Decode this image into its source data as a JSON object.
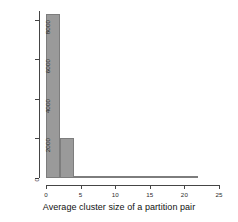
{
  "chart_data": {
    "type": "bar",
    "title": "",
    "subtitle": "",
    "xlabel": "Average cluster size of a partition pair",
    "ylabel": "Frequency of partition pairs",
    "xlim": [
      0,
      25
    ],
    "ylim": [
      0,
      8600
    ],
    "xticks": [
      0,
      5,
      10,
      15,
      20,
      25
    ],
    "yticks": [
      0,
      2000,
      4000,
      6000,
      8000
    ],
    "xtick_labels": [
      "0",
      "5",
      "10",
      "15",
      "20",
      "25"
    ],
    "ytick_labels": [
      "0",
      "2000",
      "4000",
      "6000",
      "8000"
    ],
    "grid": false,
    "legend": null,
    "bin_width": 2,
    "bin_edges": [
      0,
      2,
      4,
      6,
      8,
      10,
      12,
      14,
      16,
      18,
      20,
      22
    ],
    "categories": [
      "0-2",
      "2-4",
      "4-6",
      "6-8",
      "8-10",
      "10-12",
      "12-14",
      "14-16",
      "16-18",
      "18-20",
      "20-22"
    ],
    "values": [
      8300,
      2000,
      40,
      20,
      15,
      12,
      10,
      30,
      8,
      6,
      90
    ],
    "bars": [
      {
        "x0": 0,
        "x1": 2,
        "value": 8300
      },
      {
        "x0": 2,
        "x1": 4,
        "value": 2000
      },
      {
        "x0": 4,
        "x1": 6,
        "value": 40
      },
      {
        "x0": 6,
        "x1": 8,
        "value": 20
      },
      {
        "x0": 8,
        "x1": 10,
        "value": 15
      },
      {
        "x0": 10,
        "x1": 12,
        "value": 12
      },
      {
        "x0": 12,
        "x1": 14,
        "value": 10
      },
      {
        "x0": 14,
        "x1": 16,
        "value": 30
      },
      {
        "x0": 16,
        "x1": 18,
        "value": 8
      },
      {
        "x0": 18,
        "x1": 20,
        "value": 6
      },
      {
        "x0": 20,
        "x1": 22,
        "value": 90
      }
    ],
    "colors": {
      "bar_fill": "#9a9a9a",
      "bar_border": "#7d7d7d",
      "axis": "#454545",
      "text": "#111111",
      "background": "#ffffff"
    }
  }
}
